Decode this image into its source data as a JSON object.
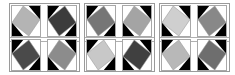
{
  "board": {
    "groups": [
      {
        "tiles": [
          {
            "diamond": "#b4b4b4",
            "corners": "tr-bl"
          },
          {
            "diamond": "#3c3c3c",
            "corners": "tl-br"
          },
          {
            "diamond": "#4a4a4a",
            "corners": "tl-br"
          },
          {
            "diamond": "#8c8c8c",
            "corners": "tr-bl"
          }
        ]
      },
      {
        "tiles": [
          {
            "diamond": "#767676",
            "corners": "tl-br"
          },
          {
            "diamond": "#a4a4a4",
            "corners": "tr-bl"
          },
          {
            "diamond": "#c8c8c8",
            "corners": "tl-br"
          },
          {
            "diamond": "#404040",
            "corners": "tr-bl"
          }
        ]
      },
      {
        "tiles": [
          {
            "diamond": "#cfcfcf",
            "corners": "tr-bl"
          },
          {
            "diamond": "#888888",
            "corners": "tl-br"
          },
          {
            "diamond": "#b8b8b8",
            "corners": "tl-br"
          },
          {
            "diamond": "#6e6e6e",
            "corners": "tr-bl"
          }
        ]
      }
    ],
    "colors": {
      "corner_dark": "#000000",
      "corner_light": "#ffffff",
      "diamond_outline": "#9a9a9a",
      "border": "#a0a0a0"
    }
  }
}
